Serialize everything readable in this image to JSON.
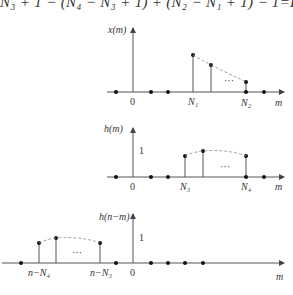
{
  "formula_top": "N₃ + 1 − (N₄ − N₃ + 1) + (N₂ − N₁ + 1) − 1=L",
  "plots": [
    {
      "ylabel": "x(m)",
      "xlabel": "m",
      "origin_label": "0",
      "tick_labels": [
        "N₁",
        "N₂"
      ],
      "ellipsis": "···"
    },
    {
      "ylabel": "h(m)",
      "xlabel": "m",
      "origin_label": "0",
      "unit_label": "1",
      "tick_labels": [
        "N₃",
        "N₄"
      ],
      "ellipsis": "···"
    },
    {
      "ylabel": "h(n−m)",
      "xlabel": "m",
      "origin_label": "0",
      "unit_label": "1",
      "tick_labels": [
        "n−N₄",
        "n−N₃"
      ],
      "ellipsis": "···"
    }
  ],
  "colors": {
    "line": "#555555",
    "dot": "#111111",
    "dashed": "#888888"
  }
}
